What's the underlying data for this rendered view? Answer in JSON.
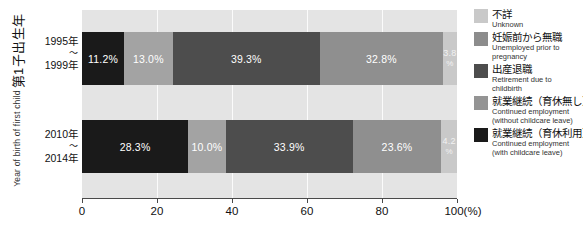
{
  "axis": {
    "y_caption_jp": "第1子出生年",
    "y_caption_en": "Year of birth of first child",
    "x_unit": "(%)"
  },
  "categories": [
    {
      "line1": "1995年",
      "tilde": "〜",
      "line2": "1999年"
    },
    {
      "line1": "2010年",
      "tilde": "〜",
      "line2": "2014年"
    }
  ],
  "x_ticks": [
    "0",
    "20",
    "40",
    "60",
    "80",
    "100"
  ],
  "legend": {
    "items": [
      {
        "jp": "不詳",
        "en_line1": "Unknown",
        "en_line2": "",
        "color": "#c9c9c9"
      },
      {
        "jp": "妊娠前から無職",
        "en_line1": "Unemployed prior to",
        "en_line2": "pregnancy",
        "color": "#8c8c8c"
      },
      {
        "jp": "出産退職",
        "en_line1": "Retirement due to",
        "en_line2": "childbirth",
        "color": "#4d4d4d"
      },
      {
        "jp": "就業継続（育休無し）",
        "en_line1": "Continued employment",
        "en_line2": "(without childcare leave)",
        "color": "#949494"
      },
      {
        "jp": "就業継続（育休利用）",
        "en_line1": "Continued employment",
        "en_line2": "(with childcare leave)",
        "color": "#1a1a1a"
      }
    ]
  },
  "chart_data": {
    "type": "bar",
    "orientation": "horizontal",
    "stacked": true,
    "title": "",
    "xlabel": "(%)",
    "ylabel": "第1子出生年 / Year of birth of first child",
    "xlim": [
      0,
      100
    ],
    "xticks": [
      0,
      20,
      40,
      60,
      80,
      100
    ],
    "grid": true,
    "legend_position": "right",
    "categories": [
      "1995年〜1999年",
      "2010年〜2014年"
    ],
    "series": [
      {
        "name": "就業継続（育休利用）",
        "name_en": "Continued employment (with childcare leave)",
        "color": "#1a1a1a",
        "values": [
          11.2,
          28.3
        ],
        "labels": [
          "11.2%",
          "28.3%"
        ]
      },
      {
        "name": "就業継続（育休無し）",
        "name_en": "Continued employment (without childcare leave)",
        "color": "#a3a3a3",
        "values": [
          13.0,
          10.0
        ],
        "labels": [
          "13.0%",
          "10.0%"
        ]
      },
      {
        "name": "出産退職",
        "name_en": "Retirement due to childbirth",
        "color": "#4d4d4d",
        "values": [
          39.3,
          33.9
        ],
        "labels": [
          "39.3%",
          "33.9%"
        ]
      },
      {
        "name": "妊娠前から無職",
        "name_en": "Unemployed prior to pregnancy",
        "color": "#8f8f8f",
        "values": [
          32.8,
          23.6
        ],
        "labels": [
          "32.8%",
          "23.6%"
        ]
      },
      {
        "name": "不詳",
        "name_en": "Unknown",
        "color": "#c9c9c9",
        "values": [
          3.8,
          4.2
        ],
        "labels": [
          "3.8",
          "4.2"
        ],
        "label_suffix": "%"
      }
    ]
  }
}
